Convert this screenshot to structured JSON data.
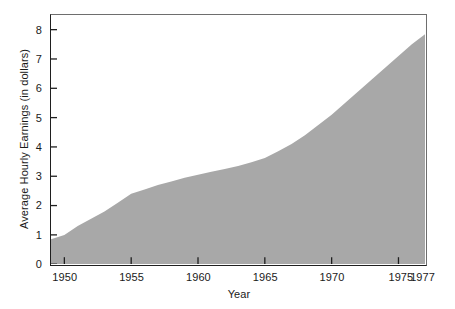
{
  "chart_data": {
    "type": "area",
    "title": "",
    "xlabel": "Year",
    "ylabel": "Average Hourly Earnings (in dollars)",
    "xlim": [
      1949,
      1977
    ],
    "ylim": [
      0,
      8.5
    ],
    "grid": false,
    "legend": false,
    "fill_color": "#a8a8a8",
    "background_color": "#ffffff",
    "axis_color": "#1f1f1f",
    "x": [
      1949,
      1950,
      1951,
      1952,
      1953,
      1954,
      1955,
      1956,
      1957,
      1958,
      1959,
      1960,
      1961,
      1962,
      1963,
      1964,
      1965,
      1966,
      1967,
      1968,
      1969,
      1970,
      1971,
      1972,
      1973,
      1974,
      1975,
      1976,
      1977
    ],
    "values": [
      0.85,
      1.0,
      1.3,
      1.55,
      1.8,
      2.1,
      2.4,
      2.55,
      2.7,
      2.82,
      2.95,
      3.05,
      3.15,
      3.25,
      3.35,
      3.48,
      3.62,
      3.85,
      4.1,
      4.4,
      4.75,
      5.1,
      5.5,
      5.9,
      6.3,
      6.7,
      7.1,
      7.5,
      7.85
    ],
    "series": [
      {
        "name": "Average Hourly Earnings",
        "values": [
          0.85,
          1.0,
          1.3,
          1.55,
          1.8,
          2.1,
          2.4,
          2.55,
          2.7,
          2.82,
          2.95,
          3.05,
          3.15,
          3.25,
          3.35,
          3.48,
          3.62,
          3.85,
          4.1,
          4.4,
          4.75,
          5.1,
          5.5,
          5.9,
          6.3,
          6.7,
          7.1,
          7.5,
          7.85
        ]
      }
    ],
    "x_ticks": [
      {
        "value": 1950,
        "label": "1950"
      },
      {
        "value": 1955,
        "label": "1955"
      },
      {
        "value": 1960,
        "label": "1960"
      },
      {
        "value": 1965,
        "label": "1965"
      },
      {
        "value": 1970,
        "label": "1970"
      },
      {
        "value": 1975,
        "label": "1975"
      },
      {
        "value": 1977,
        "label": "1977"
      }
    ],
    "y_ticks": [
      {
        "value": 0,
        "label": "0"
      },
      {
        "value": 1,
        "label": "1"
      },
      {
        "value": 2,
        "label": "2"
      },
      {
        "value": 3,
        "label": "3"
      },
      {
        "value": 4,
        "label": "4"
      },
      {
        "value": 5,
        "label": "5"
      },
      {
        "value": 6,
        "label": "6"
      },
      {
        "value": 7,
        "label": "7"
      },
      {
        "value": 8,
        "label": "8"
      }
    ]
  }
}
